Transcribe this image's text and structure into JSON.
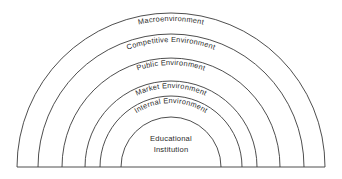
{
  "diagram": {
    "type": "concentric-semicircle",
    "line_color": "#3a3a3a",
    "text_color": "#2b2b2b",
    "background_color": "#ffffff",
    "center_x": 171,
    "baseline_y": 167,
    "baseline": {
      "x_start": 17,
      "x_end": 325
    },
    "rings": [
      {
        "index": 0,
        "label": "Macroenvironment",
        "radius": 154,
        "label_radius": 146,
        "label_style": "curved"
      },
      {
        "index": 1,
        "label": "Competitive Environment",
        "radius": 133,
        "label_radius": 125,
        "label_style": "curved"
      },
      {
        "index": 2,
        "label": "Public Environment",
        "radius": 109,
        "label_radius": 102,
        "label_style": "curved"
      },
      {
        "index": 3,
        "label": "Market Environment",
        "radius": 86,
        "label_radius": 79,
        "label_style": "curved"
      },
      {
        "index": 4,
        "label": "Internal Environment",
        "radius": 71,
        "label_radius": 64,
        "label_style": "curved"
      },
      {
        "index": 5,
        "label": "Educational Institution",
        "radius": 50,
        "label_style": "horizontal"
      }
    ],
    "center_label": {
      "line1": "Educational",
      "line2": "Institution"
    }
  }
}
